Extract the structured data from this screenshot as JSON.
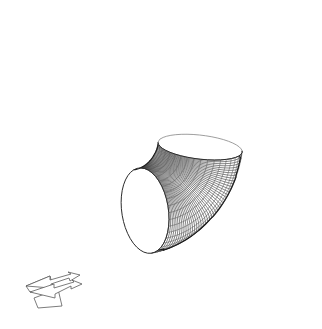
{
  "figure": {
    "title": "3D wireframe mesh of a 90 degree pipe elbow",
    "kind": "wireframe-surface-mesh",
    "background_color": "#ffffff",
    "line_color": "#3a3a3a",
    "silhouette_color": "#1a1a1a",
    "far_rim_color": "#8c8c8c",
    "canvas": {
      "width": 322,
      "height": 329
    }
  },
  "geometry": {
    "shape_name": "pipe-elbow",
    "bend_angle_degrees": 90,
    "mesh_type": "quadrilateral",
    "circumferential_divisions": 40,
    "longitudinal_divisions": 44,
    "tube_radius_px": 78,
    "bend_centerline_radius_px": 112,
    "bend_center": {
      "x": 86,
      "y": 272
    },
    "inlet_face": {
      "name": "open-elliptical-inlet",
      "filled": false,
      "center": {
        "x": 100,
        "y": 115
      },
      "semi_major_px": 93,
      "semi_minor_px": 40,
      "rotation_degrees": 102
    },
    "outlet_face": {
      "name": "outlet-rim",
      "center": {
        "x": 210,
        "y": 252
      },
      "semi_major_px": 92,
      "semi_minor_px": 27,
      "rotation_degrees": 8
    }
  },
  "axis_gizmo": {
    "name": "coordinate-axis-gizmo",
    "position": {
      "x": 24,
      "y": 272
    },
    "width": 64,
    "height": 42,
    "arrow_count": 2,
    "stroke_color": "#5a5a5a"
  }
}
